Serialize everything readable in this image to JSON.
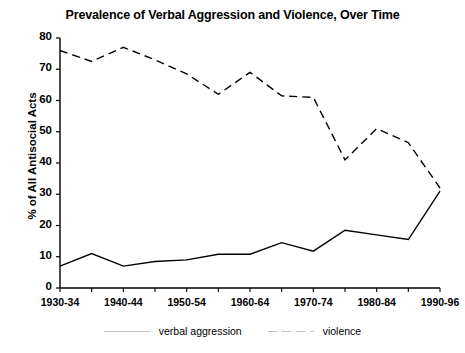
{
  "chart_data": {
    "type": "line",
    "title": "Prevalence of Verbal Aggression and Violence, Over Time",
    "xlabel": "",
    "ylabel": "% of All Antisocial Acts",
    "ylim": [
      0,
      80
    ],
    "ytick_step": 10,
    "yticks": [
      0,
      10,
      20,
      30,
      40,
      50,
      60,
      70,
      80
    ],
    "grid": false,
    "legend_position": "bottom",
    "x": [
      "1930-34",
      "1935-39",
      "1940-44",
      "1945-49",
      "1950-54",
      "1955-59",
      "1960-64",
      "1965-69",
      "1970-74",
      "1975-79",
      "1980-84",
      "1985-89",
      "1990-96"
    ],
    "xtick_labels_shown": [
      "1930-34",
      "1940-44",
      "1950-54",
      "1960-64",
      "1970-74",
      "1980-84",
      "1990-96"
    ],
    "series": [
      {
        "name": "verbal aggression",
        "style": "solid",
        "color": "#000000",
        "values": [
          7,
          11,
          7,
          8.5,
          9,
          10.8,
          10.8,
          14.5,
          11.8,
          18.5,
          17,
          15.5,
          31
        ]
      },
      {
        "name": "violence",
        "style": "dashed",
        "color": "#000000",
        "values": [
          76,
          72.5,
          77,
          73,
          68.5,
          62,
          69,
          61.5,
          61,
          41,
          51,
          46.5,
          32
        ]
      }
    ]
  },
  "legend": {
    "items": [
      {
        "label": "verbal aggression",
        "style": "solid"
      },
      {
        "label": "violence",
        "style": "dashed"
      }
    ]
  }
}
